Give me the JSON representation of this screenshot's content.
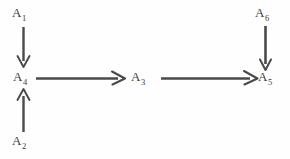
{
  "diagram": {
    "type": "flow-diagram",
    "canvas": {
      "width": 290,
      "height": 159,
      "background": "#fefefe"
    },
    "stroke_color": "#4a4a4a",
    "text_color": "#3c3c3c",
    "nodes": [
      {
        "id": "a1",
        "base": "A",
        "subscript": "1",
        "label": "A1",
        "x": 12,
        "y": 6
      },
      {
        "id": "a4",
        "base": "A",
        "subscript": "4",
        "label": "A4",
        "x": 13,
        "y": 70
      },
      {
        "id": "a2",
        "base": "A",
        "subscript": "2",
        "label": "A2",
        "x": 12,
        "y": 134
      },
      {
        "id": "a3",
        "base": "A",
        "subscript": "3",
        "label": "A3",
        "x": 131,
        "y": 70
      },
      {
        "id": "a6",
        "base": "A",
        "subscript": "6",
        "label": "A6",
        "x": 255,
        "y": 6
      },
      {
        "id": "a5",
        "base": "A",
        "subscript": "5",
        "label": "A5",
        "x": 258,
        "y": 70
      }
    ],
    "arrows": [
      {
        "id": "a1-to-a4",
        "from": "a1",
        "to": "a4",
        "direction": "down",
        "head": "open-chevron"
      },
      {
        "id": "a2-to-a4",
        "from": "a2",
        "to": "a4",
        "direction": "up",
        "head": "open-chevron"
      },
      {
        "id": "a4-to-a3",
        "from": "a4",
        "to": "a3",
        "direction": "right",
        "head": "solid"
      },
      {
        "id": "a3-to-a5",
        "from": "a3",
        "to": "a5",
        "direction": "right",
        "head": "solid"
      },
      {
        "id": "a6-to-a5",
        "from": "a6",
        "to": "a5",
        "direction": "down",
        "head": "solid"
      }
    ]
  }
}
